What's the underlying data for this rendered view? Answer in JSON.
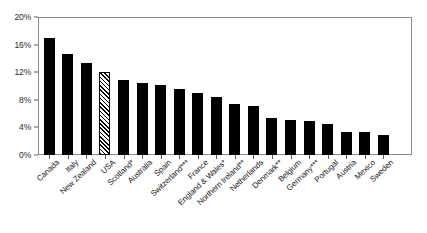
{
  "chart_data": {
    "type": "bar",
    "title": "",
    "subtitle": "",
    "xlabel": "",
    "ylabel": "",
    "ylim": [
      0,
      20
    ],
    "ytick_labels": [
      "0%",
      "4%",
      "8%",
      "12%",
      "16%",
      "20%"
    ],
    "ytick_values": [
      0,
      4,
      8,
      12,
      16,
      20
    ],
    "grid": false,
    "legend": null,
    "value_suffix": "%",
    "categories": [
      "Canada",
      "Italy",
      "New Zealand",
      "USA",
      "Scotland*",
      "Australia",
      "Spain",
      "Switzerland***",
      "France",
      "England & Wales*",
      "Northern Ireland**",
      "Netherlands",
      "Denmark**",
      "Belgium",
      "Germany***",
      "Portugal",
      "Austria",
      "Mexico",
      "Sweden"
    ],
    "values": [
      16.9,
      14.6,
      13.3,
      12.1,
      10.9,
      10.5,
      10.1,
      9.6,
      9.0,
      8.4,
      7.4,
      7.1,
      5.3,
      5.1,
      4.9,
      4.5,
      3.4,
      3.3,
      2.9
    ],
    "highlighted_category": "USA",
    "highlight_style": "diagonal-hatch",
    "bar_color": "#000000",
    "highlight_fill": "#ffffff",
    "axis_color": "#8a8a8a"
  }
}
